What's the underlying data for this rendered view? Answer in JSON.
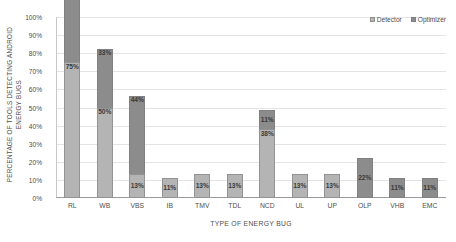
{
  "chart_data": {
    "type": "bar",
    "title": "",
    "xlabel": "TYPE OF ENERGY BUG",
    "ylabel": "PERCENTAGE OF TOOLS DETECTING ANDROID ENERGY BUGS",
    "ylabel_line1": "PERCENTAGE OF TOOLS DETECTING ANDROID",
    "ylabel_line2": "ENERGY BUGS",
    "stacked": true,
    "grid": true,
    "legend_position": "top-right",
    "ylim": [
      0,
      100
    ],
    "ytick_labels": [
      "100%",
      "90%",
      "80%",
      "70%",
      "60%",
      "50%",
      "40%",
      "30%",
      "20%",
      "10%",
      "0%"
    ],
    "ytick_values": [
      100,
      90,
      80,
      70,
      60,
      50,
      40,
      30,
      20,
      10,
      0
    ],
    "categories": [
      "RL",
      "WB",
      "VBS",
      "IB",
      "TMV",
      "TDL",
      "NCD",
      "UL",
      "UP",
      "OLP",
      "VHB",
      "EMC"
    ],
    "series": [
      {
        "name": "Detector",
        "color": "#b4b4b4",
        "values": [
          75,
          50,
          13,
          11,
          13,
          13,
          38,
          13,
          13,
          0,
          0,
          0
        ],
        "labels": [
          "75%",
          "50%",
          "13%",
          "11%",
          "13%",
          "13%",
          "38%",
          "13%",
          "13%",
          "",
          "",
          ""
        ]
      },
      {
        "name": "Optimizer",
        "color": "#8c8c8c",
        "values": [
          44,
          33,
          44,
          0,
          0,
          0,
          11,
          0,
          0,
          22,
          11,
          11
        ],
        "labels": [
          "44%",
          "33%",
          "44%",
          "",
          "",
          "",
          "11%",
          "",
          "",
          "22%",
          "11%",
          "11%"
        ]
      }
    ]
  },
  "legend": {
    "items": [
      {
        "label": "Detector"
      },
      {
        "label": "Optimizer"
      }
    ]
  }
}
